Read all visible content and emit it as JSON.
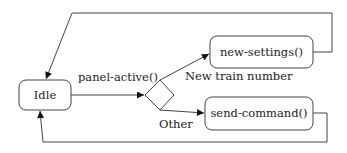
{
  "diagram": {
    "type": "state-machine",
    "nodes": {
      "idle": {
        "label": "Idle"
      },
      "decision": {
        "label": ""
      },
      "new_settings": {
        "label": "new-settings()"
      },
      "send_command": {
        "label": "send-command()"
      }
    },
    "edges": {
      "idle_to_decision": {
        "label": "panel-active()"
      },
      "decision_to_new_settings": {
        "label": "New train number"
      },
      "decision_to_send_command": {
        "label": "Other"
      },
      "new_settings_to_idle": {
        "label": ""
      },
      "send_command_to_idle": {
        "label": ""
      }
    },
    "colors": {
      "stroke": "#444444",
      "arrow": "#111111",
      "background": "#ffffff"
    }
  }
}
